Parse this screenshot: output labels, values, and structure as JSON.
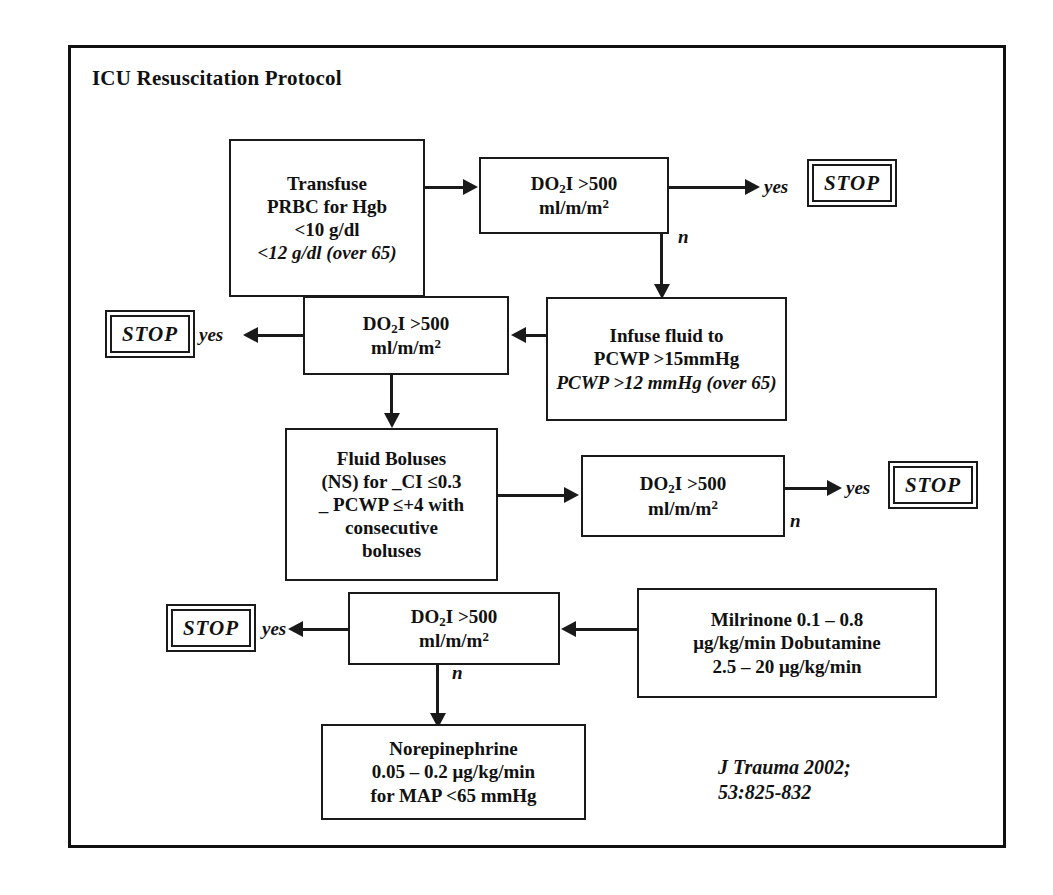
{
  "diagram": {
    "title": "ICU Resuscitation Protocol",
    "citation": "J Trauma 2002;\n53:825-832",
    "colors": {
      "line": "#1a1a1a",
      "text": "#111111",
      "background": "#ffffff"
    },
    "labels": {
      "yes": "yes",
      "no": "n",
      "stop": "STOP"
    },
    "nodes": {
      "transfuse": {
        "line1": "Transfuse",
        "line2": "PRBC for Hgb",
        "line3": "<10 g/dl",
        "line4": "<12 g/dl (over 65)"
      },
      "do2i_1": {
        "line1": "DO2I >500",
        "line2": "ml/m/m2"
      },
      "infuse_fluid": {
        "line1": "Infuse fluid to",
        "line2": "PCWP >15mmHg",
        "line3": "PCWP >12 mmHg (over 65)"
      },
      "do2i_2": {
        "line1": "DO2I >500",
        "line2": "ml/m/m2"
      },
      "fluid_boluses": {
        "line1": "Fluid Boluses",
        "line2": "(NS) for _CI ≤0.3",
        "line3": "_ PCWP ≤+4 with",
        "line4": "consecutive",
        "line5": "boluses"
      },
      "do2i_3": {
        "line1": "DO2I >500",
        "line2": "ml/m/m2"
      },
      "inotropes": {
        "line1": "Milrinone 0.1 – 0.8",
        "line2": "μg/kg/min Dobutamine",
        "line3": "2.5 – 20 μg/kg/min"
      },
      "do2i_4": {
        "line1": "DO2I >500",
        "line2": "ml/m/m2"
      },
      "norepinephrine": {
        "line1": "Norepinephrine",
        "line2": "0.05 – 0.2 μg/kg/min",
        "line3": "for MAP <65 mmHg"
      },
      "stop_1": {
        "label": "STOP"
      },
      "stop_2": {
        "label": "STOP"
      },
      "stop_3": {
        "label": "STOP"
      },
      "stop_4": {
        "label": "STOP"
      }
    },
    "edges": [
      {
        "from": "transfuse",
        "to": "do2i_1",
        "label": ""
      },
      {
        "from": "do2i_1",
        "to": "stop_1",
        "label": "yes"
      },
      {
        "from": "do2i_1",
        "to": "infuse_fluid",
        "label": "n"
      },
      {
        "from": "infuse_fluid",
        "to": "do2i_2",
        "label": ""
      },
      {
        "from": "do2i_2",
        "to": "stop_2",
        "label": "yes"
      },
      {
        "from": "do2i_2",
        "to": "fluid_boluses",
        "label": ""
      },
      {
        "from": "fluid_boluses",
        "to": "do2i_3",
        "label": ""
      },
      {
        "from": "do2i_3",
        "to": "stop_3",
        "label": "yes"
      },
      {
        "from": "do2i_3",
        "to": "inotropes",
        "label": "n"
      },
      {
        "from": "inotropes",
        "to": "do2i_4",
        "label": ""
      },
      {
        "from": "do2i_4",
        "to": "stop_4",
        "label": "yes"
      },
      {
        "from": "do2i_4",
        "to": "norepinephrine",
        "label": "n"
      }
    ]
  }
}
